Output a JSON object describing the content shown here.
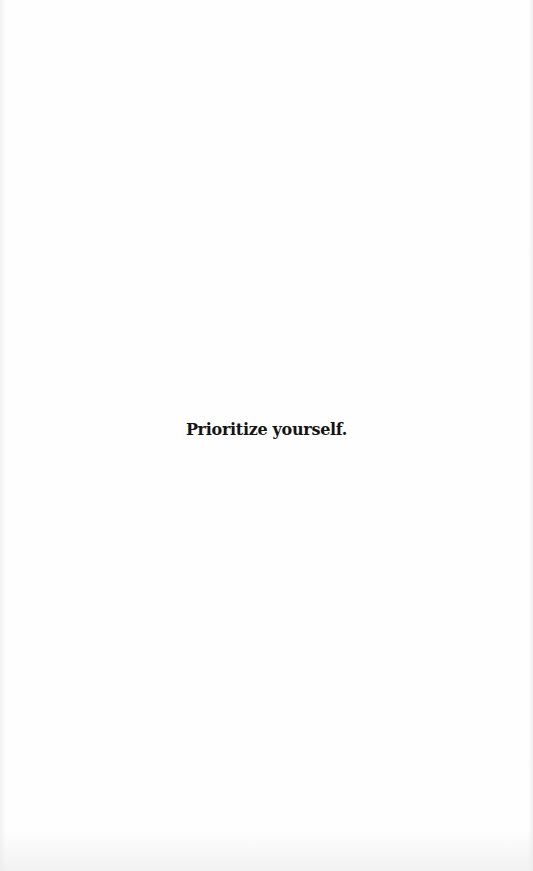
{
  "page": {
    "text": "Prioritize yourself."
  }
}
